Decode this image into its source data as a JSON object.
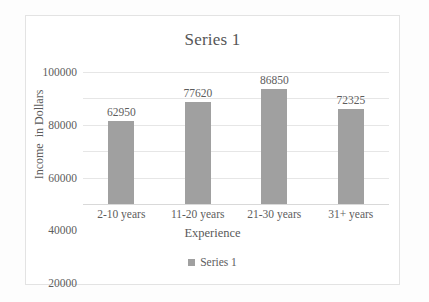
{
  "chart_data": {
    "type": "bar",
    "title": "Series 1",
    "xlabel": "Experience",
    "ylabel": "Income  in Dollars",
    "categories": [
      "2-10 years",
      "11-20 years",
      "21-30 years",
      "31+ years"
    ],
    "values": [
      62950,
      77620,
      86850,
      72325
    ],
    "value_labels": [
      "62950",
      "77620",
      "86850",
      "72325"
    ],
    "ylim": [
      0,
      100000
    ],
    "yticks": [
      100000,
      80000,
      60000,
      40000,
      20000,
      0
    ],
    "ytick_labels": [
      "100000",
      "80000",
      "60000",
      "40000",
      "20000",
      "0"
    ],
    "grid": true,
    "legend": {
      "position": "bottom",
      "entries": [
        {
          "label": "Series 1",
          "color": "#a0a0a0"
        }
      ]
    },
    "series": [
      {
        "name": "Series 1",
        "color": "#a0a0a0",
        "values": [
          62950,
          77620,
          86850,
          72325
        ]
      }
    ],
    "colors": {
      "bar": "#a0a0a0",
      "gridline": "#e6e6e6",
      "text": "#5d5d5d",
      "frame": "#e3e3e3",
      "background": "#ffffff"
    }
  }
}
